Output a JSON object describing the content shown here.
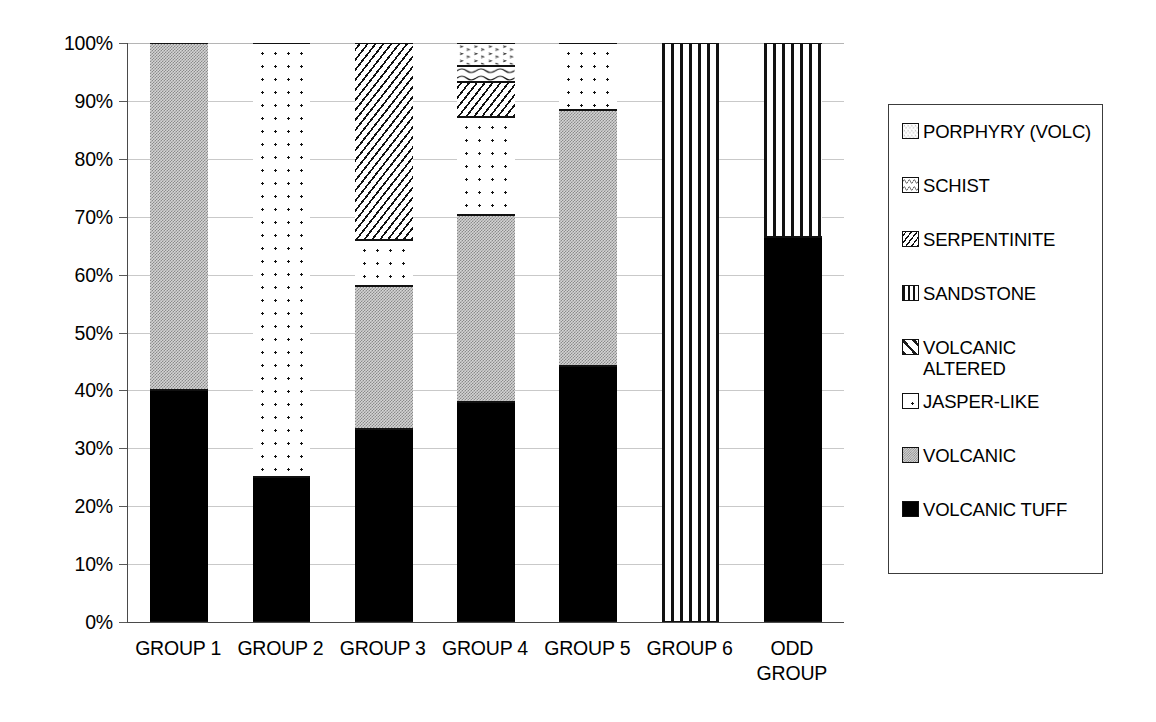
{
  "chart_data": {
    "type": "bar",
    "subtype": "stacked-100-percent",
    "title": "",
    "xlabel": "",
    "ylabel": "",
    "ylim": [
      0,
      100
    ],
    "grid": true,
    "legend_position": "right",
    "categories": [
      "GROUP 1",
      "GROUP 2",
      "GROUP 3",
      "GROUP 4",
      "GROUP 5",
      "GROUP 6",
      "ODD\nGROUP"
    ],
    "ytick_labels": [
      "0%",
      "10%",
      "20%",
      "30%",
      "40%",
      "50%",
      "60%",
      "70%",
      "80%",
      "90%",
      "100%"
    ],
    "ytick_values": [
      0,
      10,
      20,
      30,
      40,
      50,
      60,
      70,
      80,
      90,
      100
    ],
    "series": [
      {
        "name": "VOLCANIC TUFF",
        "pattern": "solid-black",
        "values": [
          40.0,
          25.0,
          33.3,
          38.0,
          44.2,
          0.0,
          66.5
        ]
      },
      {
        "name": "VOLCANIC",
        "pattern": "grey-check",
        "values": [
          60.0,
          0.0,
          24.7,
          32.3,
          44.3,
          0.0,
          0.0
        ]
      },
      {
        "name": "JASPER-LIKE",
        "pattern": "dots",
        "values": [
          0.0,
          75.0,
          8.0,
          17.0,
          11.5,
          0.0,
          0.0
        ]
      },
      {
        "name": "VOLCANIC ALTERED",
        "pattern": "diag-wide",
        "values": [
          0.0,
          0.0,
          0.0,
          0.0,
          0.0,
          0.0,
          0.0
        ]
      },
      {
        "name": "SANDSTONE",
        "pattern": "vstripe",
        "values": [
          0.0,
          0.0,
          0.0,
          0.0,
          0.0,
          100.0,
          33.5
        ]
      },
      {
        "name": "SERPENTINITE",
        "pattern": "backslash-small",
        "values": [
          0.0,
          0.0,
          34.0,
          5.9,
          0.0,
          0.0,
          0.0
        ]
      },
      {
        "name": "SCHIST",
        "pattern": "wave",
        "values": [
          0.0,
          0.0,
          0.0,
          2.9,
          0.0,
          0.0,
          0.0
        ]
      },
      {
        "name": "PORPHYRY (VOLC)",
        "pattern": "porphyry",
        "values": [
          0.0,
          0.0,
          0.0,
          3.9,
          0.0,
          0.0,
          0.0
        ]
      }
    ]
  },
  "legend": {
    "items": [
      {
        "label": "PORPHYRY (VOLC)",
        "pattern": "porphyry"
      },
      {
        "label": "SCHIST",
        "pattern": "wave"
      },
      {
        "label": "SERPENTINITE",
        "pattern": "backslash-small"
      },
      {
        "label": "SANDSTONE",
        "pattern": "vstripe"
      },
      {
        "label": "VOLCANIC\nALTERED",
        "pattern": "diag-wide"
      },
      {
        "label": "JASPER-LIKE",
        "pattern": "dots"
      },
      {
        "label": "VOLCANIC",
        "pattern": "grey-check"
      },
      {
        "label": "VOLCANIC TUFF",
        "pattern": "solid-black"
      }
    ]
  },
  "colors": {
    "axis": "#4a4a4a",
    "gridline": "#c9c9c9",
    "outline": "#111111",
    "grey_fill": "#d4d4d4",
    "black_fill": "#000000",
    "background": "#ffffff"
  }
}
